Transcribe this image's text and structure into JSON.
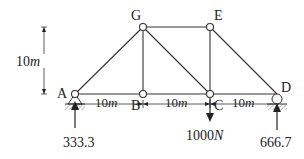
{
  "diagram": {
    "type": "truss",
    "joints": [
      {
        "id": "A",
        "label": "A",
        "x": 75,
        "y": 94
      },
      {
        "id": "B",
        "label": "B",
        "x": 143,
        "y": 94
      },
      {
        "id": "C",
        "label": "C",
        "x": 210,
        "y": 94
      },
      {
        "id": "D",
        "label": "D",
        "x": 277,
        "y": 94
      },
      {
        "id": "G",
        "label": "G",
        "x": 143,
        "y": 27
      },
      {
        "id": "E",
        "label": "E",
        "x": 210,
        "y": 27
      }
    ],
    "members": [
      [
        "A",
        "B"
      ],
      [
        "B",
        "C"
      ],
      [
        "C",
        "D"
      ],
      [
        "G",
        "E"
      ],
      [
        "A",
        "G"
      ],
      [
        "G",
        "B"
      ],
      [
        "G",
        "C"
      ],
      [
        "E",
        "C"
      ],
      [
        "E",
        "D"
      ]
    ],
    "dimensions": {
      "height": "10m",
      "spans": [
        "10m",
        "10m",
        "10m"
      ]
    },
    "loads": {
      "applied": {
        "joint": "C",
        "value": "1000N",
        "direction": "down"
      },
      "reaction_A": {
        "joint": "A",
        "value": "333.3",
        "direction": "up"
      },
      "reaction_D": {
        "joint": "D",
        "value": "666.7",
        "direction": "up"
      }
    },
    "labels": {
      "A": "A",
      "B": "B",
      "C": "C",
      "D": "D",
      "G": "G",
      "E": "E",
      "height_num": "10",
      "height_unit": "m",
      "span1_num": "10",
      "span1_unit": "m",
      "span2_num": "10",
      "span2_unit": "m",
      "span3_num": "10",
      "span3_unit": "m",
      "load_num": "1000",
      "load_unit": "N",
      "reaction_A": "333.3",
      "reaction_D": "666.7"
    }
  }
}
